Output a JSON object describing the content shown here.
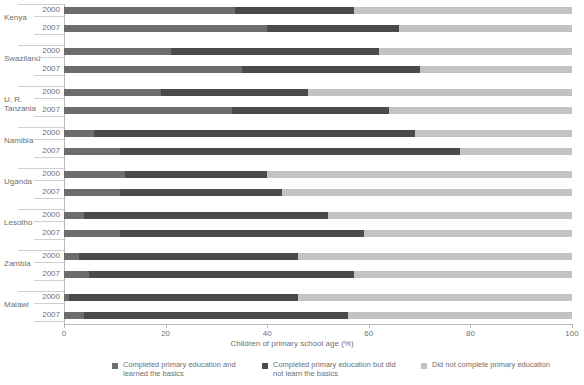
{
  "chart_data": {
    "type": "bar",
    "orientation": "horizontal",
    "stacked": true,
    "title": "",
    "xlabel": "Children of primary school age (%)",
    "ylabel": "",
    "xlim": [
      0,
      100
    ],
    "xticks": [
      0,
      20,
      40,
      60,
      80,
      100
    ],
    "grid": false,
    "legend_position": "bottom",
    "series": [
      {
        "name": "Completed primary education and learned the basics",
        "color": "#6d6d6d",
        "values": [
          33.6,
          40.0,
          21.0,
          35.0,
          19.0,
          33.0,
          6.0,
          11.0,
          12.0,
          11.0,
          4.0,
          11.0,
          3.0,
          5.0,
          1.0,
          4.0
        ]
      },
      {
        "name": "Completed primary education but did not learn the basics",
        "color": "#4a4a4a",
        "values": [
          23.4,
          26.0,
          41.0,
          35.0,
          29.0,
          31.0,
          63.0,
          67.0,
          28.0,
          32.0,
          48.0,
          48.0,
          43.0,
          52.0,
          45.0,
          52.0
        ]
      },
      {
        "name": "Did not complete primary education",
        "color": "#c3c3c3",
        "values": [
          43.0,
          34.0,
          38.0,
          30.0,
          52.0,
          36.0,
          31.0,
          22.0,
          60.0,
          57.0,
          48.0,
          41.0,
          54.0,
          43.0,
          54.0,
          44.0
        ]
      }
    ],
    "categories": [
      "Kenya 2000",
      "Kenya 2007",
      "Swaziland 2000",
      "Swaziland 2007",
      "U. R. Tanzania 2000",
      "U. R. Tanzania 2007",
      "Namibia 2000",
      "Namibia 2007",
      "Uganda 2000",
      "Uganda 2007",
      "Lesotho 2000",
      "Lesotho 2007",
      "Zambia 2000",
      "Zambia 2007",
      "Malawi 2000",
      "Malawi 2007"
    ],
    "groups": [
      {
        "country": "Kenya",
        "rows": [
          {
            "year": "2000",
            "segments": [
              33.6,
              23.4,
              43.0
            ]
          },
          {
            "year": "2007",
            "segments": [
              40.0,
              26.0,
              34.0
            ]
          }
        ]
      },
      {
        "country": "Swaziland",
        "rows": [
          {
            "year": "2000",
            "segments": [
              21.0,
              41.0,
              38.0
            ]
          },
          {
            "year": "2007",
            "segments": [
              35.0,
              35.0,
              30.0
            ]
          }
        ]
      },
      {
        "country": "U. R. Tanzania",
        "rows": [
          {
            "year": "2000",
            "segments": [
              19.0,
              29.0,
              52.0
            ]
          },
          {
            "year": "2007",
            "segments": [
              33.0,
              31.0,
              36.0
            ]
          }
        ]
      },
      {
        "country": "Namibia",
        "rows": [
          {
            "year": "2000",
            "segments": [
              6.0,
              63.0,
              31.0
            ]
          },
          {
            "year": "2007",
            "segments": [
              11.0,
              67.0,
              22.0
            ]
          }
        ]
      },
      {
        "country": "Uganda",
        "rows": [
          {
            "year": "2000",
            "segments": [
              12.0,
              28.0,
              60.0
            ]
          },
          {
            "year": "2007",
            "segments": [
              11.0,
              32.0,
              57.0
            ]
          }
        ]
      },
      {
        "country": "Lesotho",
        "rows": [
          {
            "year": "2000",
            "segments": [
              4.0,
              48.0,
              48.0
            ]
          },
          {
            "year": "2007",
            "segments": [
              11.0,
              48.0,
              41.0
            ]
          }
        ]
      },
      {
        "country": "Zambia",
        "rows": [
          {
            "year": "2000",
            "segments": [
              3.0,
              43.0,
              54.0
            ]
          },
          {
            "year": "2007",
            "segments": [
              5.0,
              52.0,
              43.0
            ]
          }
        ]
      },
      {
        "country": "Malawi",
        "rows": [
          {
            "year": "2000",
            "segments": [
              1.0,
              45.0,
              54.0
            ]
          },
          {
            "year": "2007",
            "segments": [
              4.0,
              52.0,
              44.0
            ]
          }
        ]
      }
    ],
    "legend": [
      {
        "label": "Completed primary education and learned the basics",
        "color": "#6d6d6d"
      },
      {
        "label": "Completed primary education but did not learn the basics",
        "color": "#4a4a4a"
      },
      {
        "label": "Did not complete primary education",
        "color": "#c3c3c3"
      }
    ]
  },
  "axis": {
    "title": "Children of primary school age (%)",
    "tick_labels": [
      "0",
      "20",
      "40",
      "60",
      "80",
      "100"
    ]
  }
}
